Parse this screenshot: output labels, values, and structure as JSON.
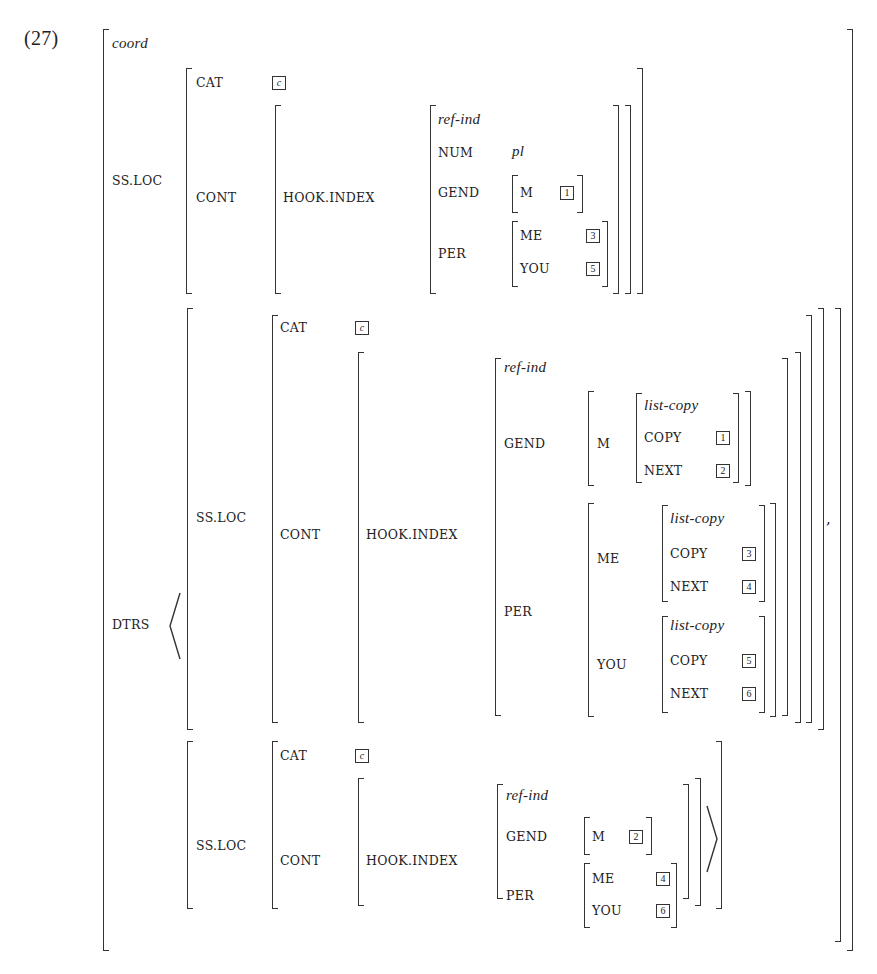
{
  "example_number": "(27)",
  "avm": {
    "type": "coord",
    "mother": {
      "attr": "SS.LOC",
      "cat": {
        "attr": "CAT",
        "tag": "c"
      },
      "cont": {
        "attr": "CONT",
        "hook": "HOOK.INDEX",
        "index": {
          "type": "ref-ind",
          "num": {
            "attr": "NUM",
            "value": "pl"
          },
          "gend": {
            "attr": "GEND",
            "m_attr": "M",
            "m_tag": "1"
          },
          "per": {
            "attr": "PER",
            "me_attr": "ME",
            "me_tag": "3",
            "you_attr": "YOU",
            "you_tag": "5"
          }
        }
      }
    },
    "dtrs": {
      "attr": "DTRS",
      "separator": ",",
      "first": {
        "attr": "SS.LOC",
        "cat": {
          "attr": "CAT",
          "tag": "c"
        },
        "cont": {
          "attr": "CONT",
          "hook": "HOOK.INDEX",
          "index": {
            "type": "ref-ind",
            "gend": {
              "attr": "GEND",
              "m_attr": "M",
              "m_val": {
                "type": "list-copy",
                "copy_attr": "COPY",
                "copy_tag": "1",
                "next_attr": "NEXT",
                "next_tag": "2"
              }
            },
            "per": {
              "attr": "PER",
              "me_attr": "ME",
              "me_val": {
                "type": "list-copy",
                "copy_attr": "COPY",
                "copy_tag": "3",
                "next_attr": "NEXT",
                "next_tag": "4"
              },
              "you_attr": "YOU",
              "you_val": {
                "type": "list-copy",
                "copy_attr": "COPY",
                "copy_tag": "5",
                "next_attr": "NEXT",
                "next_tag": "6"
              }
            }
          }
        }
      },
      "second": {
        "attr": "SS.LOC",
        "cat": {
          "attr": "CAT",
          "tag": "c"
        },
        "cont": {
          "attr": "CONT",
          "hook": "HOOK.INDEX",
          "index": {
            "type": "ref-ind",
            "gend": {
              "attr": "GEND",
              "m_attr": "M",
              "m_tag": "2"
            },
            "per": {
              "attr": "PER",
              "me_attr": "ME",
              "me_tag": "4",
              "you_attr": "YOU",
              "you_tag": "6"
            }
          }
        }
      }
    }
  }
}
